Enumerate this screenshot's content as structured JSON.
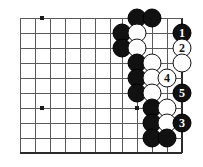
{
  "diagram": {
    "type": "go-board-diagram",
    "board": {
      "grid_color": "#5a5a5a",
      "edge_color": "#2b2b2b",
      "background": "#ffffff",
      "cell_size": 15,
      "origin_x": 20,
      "origin_y": 18,
      "columns_x": [
        20,
        35,
        50,
        65,
        80,
        95,
        110,
        122,
        137,
        152,
        167,
        182
      ],
      "rows_y": [
        18,
        33,
        48,
        63,
        78,
        93,
        108,
        123,
        138,
        153
      ],
      "right_edge_x": 182,
      "bottom_edge_y": 153
    },
    "star_points": [
      {
        "name": "star-point-upper-left",
        "x": 42,
        "y": 18
      },
      {
        "name": "star-point-lower-left",
        "x": 42,
        "y": 108
      },
      {
        "name": "star-point-lower-right",
        "x": 137,
        "y": 108
      }
    ],
    "black_color": "#111111",
    "white_color": "#ffffff",
    "stones": [
      {
        "id": "black-a",
        "color": "black",
        "x": 137,
        "y": 18,
        "label": ""
      },
      {
        "id": "black-b",
        "color": "black",
        "x": 152,
        "y": 18,
        "label": ""
      },
      {
        "id": "black-c",
        "color": "black",
        "x": 122,
        "y": 33,
        "label": ""
      },
      {
        "id": "white-a",
        "color": "white",
        "x": 137,
        "y": 33,
        "label": ""
      },
      {
        "id": "move-1",
        "color": "black",
        "x": 182,
        "y": 33,
        "label": "1"
      },
      {
        "id": "black-d",
        "color": "black",
        "x": 122,
        "y": 48,
        "label": ""
      },
      {
        "id": "white-b",
        "color": "white",
        "x": 137,
        "y": 48,
        "label": ""
      },
      {
        "id": "move-2",
        "color": "white",
        "x": 182,
        "y": 48,
        "label": "2"
      },
      {
        "id": "black-e",
        "color": "black",
        "x": 137,
        "y": 63,
        "label": ""
      },
      {
        "id": "white-c",
        "color": "white",
        "x": 152,
        "y": 63,
        "label": ""
      },
      {
        "id": "white-d",
        "color": "white",
        "x": 182,
        "y": 63,
        "label": ""
      },
      {
        "id": "black-f",
        "color": "black",
        "x": 137,
        "y": 78,
        "label": ""
      },
      {
        "id": "white-e",
        "color": "white",
        "x": 152,
        "y": 78,
        "label": ""
      },
      {
        "id": "move-4",
        "color": "white",
        "x": 167,
        "y": 78,
        "label": "4"
      },
      {
        "id": "black-g",
        "color": "black",
        "x": 137,
        "y": 93,
        "label": ""
      },
      {
        "id": "white-f",
        "color": "white",
        "x": 152,
        "y": 93,
        "label": ""
      },
      {
        "id": "move-5",
        "color": "black",
        "x": 182,
        "y": 93,
        "label": "5"
      },
      {
        "id": "black-h",
        "color": "black",
        "x": 152,
        "y": 108,
        "label": ""
      },
      {
        "id": "white-g",
        "color": "white",
        "x": 167,
        "y": 108,
        "label": ""
      },
      {
        "id": "black-i",
        "color": "black",
        "x": 152,
        "y": 123,
        "label": ""
      },
      {
        "id": "white-h",
        "color": "white",
        "x": 167,
        "y": 123,
        "label": ""
      },
      {
        "id": "move-3",
        "color": "black",
        "x": 182,
        "y": 123,
        "label": "3"
      },
      {
        "id": "black-j",
        "color": "black",
        "x": 152,
        "y": 138,
        "label": ""
      },
      {
        "id": "black-k",
        "color": "black",
        "x": 167,
        "y": 138,
        "label": ""
      }
    ],
    "move_sequence": [
      "1",
      "2",
      "3",
      "4",
      "5"
    ]
  }
}
